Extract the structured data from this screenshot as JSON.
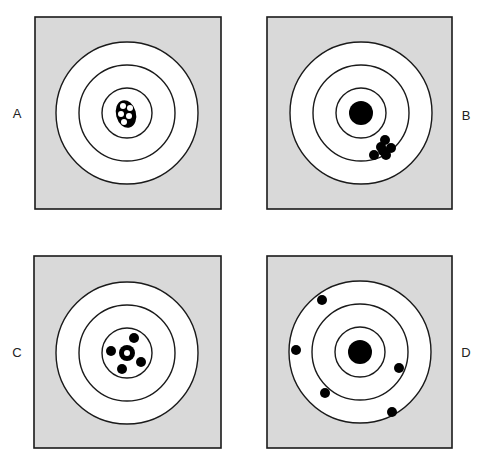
{
  "figure": {
    "colors": {
      "panel_fill": "#d9d9d9",
      "ring_fill": "#ffffff",
      "stroke": "#1a1a1a",
      "shot": "#000000"
    },
    "panels": [
      {
        "label": "A",
        "description": "Tight cluster centered on bullseye",
        "label_pos": [
          17,
          113
        ],
        "square": [
          35,
          17,
          186,
          192
        ],
        "center": [
          127,
          113
        ],
        "rings": [
          71,
          48,
          25
        ],
        "bullseye": null,
        "cluster_blob": {
          "cx": 126,
          "cy": 114,
          "rx": 10,
          "ry": 14
        },
        "holes": [
          [
            123,
            106
          ],
          [
            130,
            108
          ],
          [
            121,
            114
          ],
          [
            129,
            116
          ],
          [
            124,
            122
          ]
        ],
        "shots": []
      },
      {
        "label": "B",
        "description": "Tight cluster offset from bullseye",
        "label_pos": [
          466,
          115
        ],
        "square": [
          267,
          17,
          185,
          192
        ],
        "center": [
          361,
          113
        ],
        "rings": [
          71,
          48,
          25
        ],
        "bullseye": 12,
        "shots": [
          [
            385,
            140
          ],
          [
            381,
            147
          ],
          [
            391,
            148
          ],
          [
            386,
            155
          ],
          [
            374,
            155
          ],
          [
            383,
            151
          ]
        ]
      },
      {
        "label": "C",
        "description": "Shots spread evenly around center",
        "label_pos": [
          17,
          352
        ],
        "square": [
          34,
          256,
          187,
          192
        ],
        "center": [
          127,
          353
        ],
        "rings": [
          71,
          48,
          25
        ],
        "bullseye": null,
        "center_ring": {
          "r": 8,
          "hole": 3
        },
        "shots": [
          [
            134,
            338
          ],
          [
            111,
            351
          ],
          [
            141,
            362
          ],
          [
            122,
            369
          ]
        ]
      },
      {
        "label": "D",
        "description": "Shots widely scattered",
        "label_pos": [
          466,
          352
        ],
        "square": [
          267,
          256,
          185,
          192
        ],
        "center": [
          360,
          352
        ],
        "rings": [
          71,
          48,
          25
        ],
        "bullseye": 12,
        "shots": [
          [
            322,
            300
          ],
          [
            296,
            350
          ],
          [
            399,
            368
          ],
          [
            325,
            393
          ],
          [
            392,
            412
          ]
        ]
      }
    ]
  }
}
